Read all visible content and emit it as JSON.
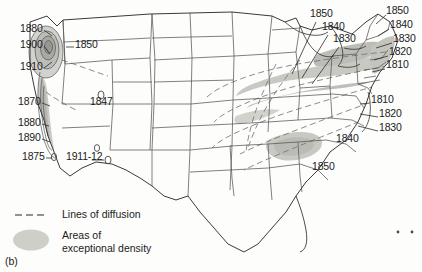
{
  "figure": {
    "label": "(b)",
    "caption_marks": "* *"
  },
  "legend": {
    "diffusion": "Lines of diffusion",
    "density_line1": "Areas of",
    "density_line2": "exceptional density"
  },
  "colors": {
    "background": "#fdfdfc",
    "border": "#4a4a4a",
    "coast": "#3a3a3a",
    "density_fill": "#c9c9c4",
    "density_fill_dark": "#a8a8a3",
    "diffusion_line": "#6e6e6e",
    "text": "#1b1b1b"
  },
  "map": {
    "name": "united-states-diffusion-map",
    "annotations": [
      {
        "id": "a-1880-nw",
        "text": "1880",
        "x": 20,
        "y": 28,
        "align": "left"
      },
      {
        "id": "a-1900-nw",
        "text": "1900",
        "x": 20,
        "y": 44,
        "align": "left"
      },
      {
        "id": "a-1910-nw",
        "text": "1910",
        "x": 20,
        "y": 66,
        "align": "left"
      },
      {
        "id": "a-1850-wa",
        "text": "1850",
        "x": 52,
        "y": 44,
        "align": "left"
      },
      {
        "id": "a-1870-ca",
        "text": "1870",
        "x": 18,
        "y": 101,
        "align": "left"
      },
      {
        "id": "a-1880-ca",
        "text": "1880",
        "x": 18,
        "y": 122,
        "align": "left"
      },
      {
        "id": "a-1890-ca",
        "text": "1890",
        "x": 18,
        "y": 137,
        "align": "left"
      },
      {
        "id": "a-1875-ca",
        "text": "1875",
        "x": 22,
        "y": 156,
        "align": "left"
      },
      {
        "id": "a-1847-ut",
        "text": "1847",
        "x": 90,
        "y": 101,
        "align": "left"
      },
      {
        "id": "a-1911-12-nv",
        "text": "1911-12",
        "x": 68,
        "y": 156,
        "align": "left"
      },
      {
        "id": "a-1850-gl",
        "text": "1850",
        "x": 310,
        "y": 13,
        "align": "left"
      },
      {
        "id": "a-1840-gl",
        "text": "1840",
        "x": 322,
        "y": 26,
        "align": "left"
      },
      {
        "id": "a-1830-gl",
        "text": "1830",
        "x": 333,
        "y": 38,
        "align": "left"
      },
      {
        "id": "a-1850-ne",
        "text": "1850",
        "x": 386,
        "y": 10,
        "align": "left"
      },
      {
        "id": "a-1840-ne",
        "text": "1840",
        "x": 390,
        "y": 24,
        "align": "left"
      },
      {
        "id": "a-1830-ne",
        "text": "1830",
        "x": 393,
        "y": 38,
        "align": "left"
      },
      {
        "id": "a-1820-ne",
        "text": "1820",
        "x": 389,
        "y": 51,
        "align": "left"
      },
      {
        "id": "a-1810-ne",
        "text": "1810",
        "x": 386,
        "y": 64,
        "align": "left"
      },
      {
        "id": "a-1810-ma",
        "text": "1810",
        "x": 371,
        "y": 99,
        "align": "left"
      },
      {
        "id": "a-1820-ma",
        "text": "1820",
        "x": 379,
        "y": 113,
        "align": "left"
      },
      {
        "id": "a-1830-ma",
        "text": "1830",
        "x": 379,
        "y": 127,
        "align": "left"
      },
      {
        "id": "a-1840-se",
        "text": "1840",
        "x": 336,
        "y": 138,
        "align": "left"
      },
      {
        "id": "a-1850-se",
        "text": "1850",
        "x": 312,
        "y": 166,
        "align": "left"
      }
    ],
    "site_markers": [
      {
        "id": "marker-1847-ut",
        "x": 101,
        "y": 95
      },
      {
        "id": "marker-1911-nv",
        "x": 97,
        "y": 148
      },
      {
        "id": "marker-1912-nv",
        "x": 108,
        "y": 160
      },
      {
        "id": "marker-1875-ca",
        "x": 54,
        "y": 157
      }
    ]
  }
}
